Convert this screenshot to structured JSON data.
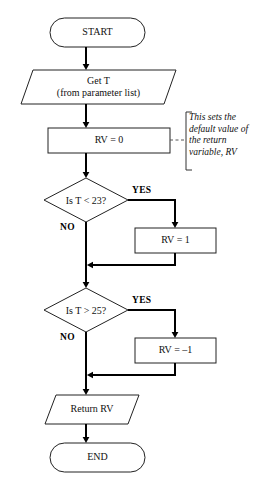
{
  "diagram": {
    "type": "flowchart",
    "background_color": "#ffffff",
    "line_color": "#000000",
    "text_color": "#111111"
  },
  "nodes": {
    "start": {
      "label": "START",
      "shape": "terminator"
    },
    "input": {
      "line1": "Get T",
      "line2": "(from parameter list)",
      "shape": "parallelogram"
    },
    "init": {
      "label": "RV = 0",
      "shape": "process"
    },
    "decision1": {
      "label": "Is T < 23?",
      "shape": "decision"
    },
    "assign1": {
      "label": "RV = 1",
      "shape": "process"
    },
    "decision2": {
      "label": "Is T > 25?",
      "shape": "decision"
    },
    "assign2": {
      "label": "RV = –1",
      "shape": "process"
    },
    "output": {
      "label": "Return RV",
      "shape": "parallelogram"
    },
    "end": {
      "label": "END",
      "shape": "terminator"
    }
  },
  "branch_labels": {
    "yes1": "YES",
    "no1": "NO",
    "yes2": "YES",
    "no2": "NO"
  },
  "annotation": {
    "line1": "This sets the",
    "line2": "default value of",
    "line3": "the return",
    "line4": "variable, RV"
  }
}
